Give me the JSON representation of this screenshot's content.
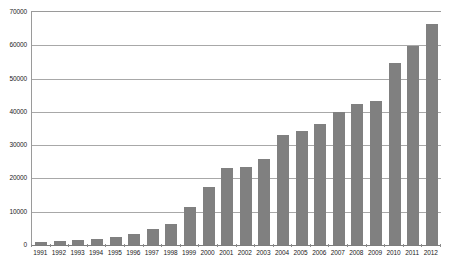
{
  "chart_data": {
    "type": "bar",
    "title": "",
    "xlabel": "",
    "ylabel": "",
    "categories": [
      "1991",
      "1992",
      "1993",
      "1994",
      "1995",
      "1996",
      "1997",
      "1998",
      "1999",
      "2000",
      "2001",
      "2002",
      "2003",
      "2004",
      "2005",
      "2006",
      "2007",
      "2008",
      "2009",
      "2010",
      "2011",
      "2012"
    ],
    "values": [
      900,
      1100,
      1500,
      1800,
      2500,
      3300,
      4800,
      6300,
      11500,
      17500,
      23000,
      23500,
      25800,
      33000,
      34200,
      36500,
      40000,
      42300,
      43300,
      54800,
      59800,
      66500
    ],
    "series": [
      {
        "name": "",
        "values": [
          900,
          1100,
          1500,
          1800,
          2500,
          3300,
          4800,
          6300,
          11500,
          17500,
          23000,
          23500,
          25800,
          33000,
          34200,
          36500,
          40000,
          42300,
          43300,
          54800,
          59800,
          66500
        ]
      }
    ],
    "ylim": [
      0,
      70000
    ],
    "yticks": [
      0,
      10000,
      20000,
      30000,
      40000,
      50000,
      60000,
      70000
    ],
    "ytick_labels": [
      "0",
      "10000",
      "20000",
      "30000",
      "40000",
      "50000",
      "60000",
      "70000"
    ],
    "grid": true,
    "legend": null,
    "legend_position": "none",
    "bar_color": "#808080",
    "gridline_color": "#a8a8a8",
    "axis_color": "#9a9a9a",
    "background_color": "#ffffff"
  }
}
